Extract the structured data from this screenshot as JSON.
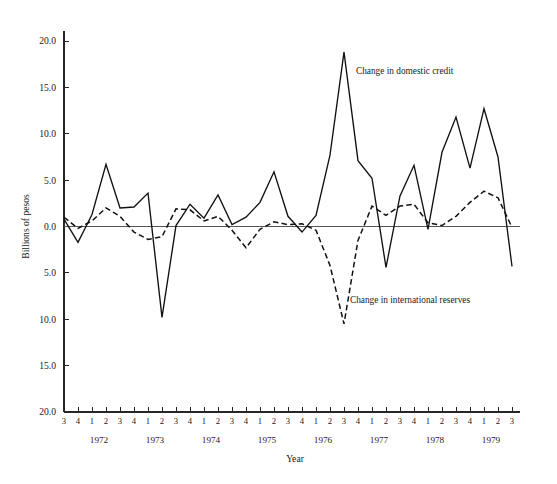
{
  "chart_data": {
    "type": "line",
    "title": "",
    "xlabel": "Year",
    "ylabel": "Billions of pesos",
    "ylim": [
      -20.0,
      20.0
    ],
    "grid": false,
    "legend_position": "inline-annotation",
    "y_ticks": [
      20.0,
      15.0,
      10.0,
      5.0,
      0.0,
      -5.0,
      -10.0,
      -15.0,
      -20.0
    ],
    "y_tick_labels": [
      "20.0",
      "15.0",
      "10.0",
      "5.0",
      "0.0",
      "5.0",
      "10.0",
      "15.0",
      "20.0"
    ],
    "x": [
      "1971 Q3",
      "1971 Q4",
      "1972 Q1",
      "1972 Q2",
      "1972 Q3",
      "1972 Q4",
      "1973 Q1",
      "1973 Q2",
      "1973 Q3",
      "1973 Q4",
      "1974 Q1",
      "1974 Q2",
      "1974 Q3",
      "1974 Q4",
      "1975 Q1",
      "1975 Q2",
      "1975 Q3",
      "1975 Q4",
      "1976 Q1",
      "1976 Q2",
      "1976 Q3",
      "1976 Q4",
      "1977 Q1",
      "1977 Q2",
      "1977 Q3",
      "1977 Q4",
      "1978 Q1",
      "1978 Q2",
      "1978 Q3",
      "1978 Q4",
      "1979 Q1",
      "1979 Q2",
      "1979 Q3"
    ],
    "quarter_tick_labels": [
      "3",
      "4",
      "1",
      "2",
      "3",
      "4",
      "1",
      "2",
      "3",
      "4",
      "1",
      "2",
      "3",
      "4",
      "1",
      "2",
      "3",
      "4",
      "1",
      "2",
      "3",
      "4",
      "1",
      "2",
      "3",
      "4",
      "1",
      "2",
      "3",
      "4",
      "1",
      "2",
      "3"
    ],
    "year_tick_labels": [
      "1972",
      "1973",
      "1974",
      "1975",
      "1976",
      "1977",
      "1978",
      "1979"
    ],
    "year_tick_index": [
      3,
      7,
      11,
      15,
      19,
      23,
      27,
      31
    ],
    "series": [
      {
        "name": "Change in domestic credit",
        "style": "solid",
        "values": [
          0.8,
          -1.7,
          1.3,
          6.7,
          2.0,
          2.1,
          3.6,
          -9.8,
          0.1,
          2.4,
          0.9,
          3.4,
          0.2,
          1.0,
          2.6,
          5.9,
          1.1,
          -0.6,
          1.2,
          7.7,
          18.8,
          7.1,
          5.2,
          -4.4,
          3.3,
          6.6,
          -0.3,
          8.0,
          11.8,
          6.3,
          12.7,
          7.5,
          -4.3
        ]
      },
      {
        "name": "Change in international reserves",
        "style": "dashed",
        "values": [
          1.0,
          -0.2,
          0.6,
          2.0,
          1.1,
          -0.6,
          -1.4,
          -1.1,
          1.9,
          1.8,
          0.6,
          1.1,
          -0.4,
          -2.3,
          -0.3,
          0.5,
          0.2,
          0.3,
          -0.4,
          -4.2,
          -10.5,
          -1.5,
          2.2,
          1.2,
          2.2,
          2.4,
          0.4,
          0.1,
          1.1,
          2.6,
          3.8,
          3.1,
          -0.1
        ]
      }
    ],
    "annotations": [
      {
        "text": "Change in domestic credit",
        "series": "Change in domestic credit",
        "x_px": 356,
        "y_px": 74
      },
      {
        "text": "Change in international reserves",
        "series": "Change in international reserves",
        "x_px": 350,
        "y_px": 303
      }
    ]
  }
}
